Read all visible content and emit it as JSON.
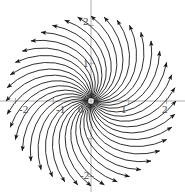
{
  "figure": {
    "kind": "vector-field-phase-portrait",
    "title": "",
    "background_color": "#ffffff",
    "arrow_color": "#1a1a1a",
    "axis_color": "#9a9a9a",
    "label_color": "#4a4a4a"
  },
  "axes": {
    "x_axis_y_pixel": 101,
    "y_axis_x_pixel": 91,
    "xlabels": [
      {
        "text": "-2",
        "value": -2,
        "x": 19,
        "y": 104
      },
      {
        "text": "-1",
        "value": -1,
        "x": 56,
        "y": 104
      },
      {
        "text": "0",
        "value": 0,
        "x": 78,
        "y": 104
      },
      {
        "text": "1",
        "value": 1,
        "x": 121,
        "y": 104
      },
      {
        "text": "2",
        "value": 2,
        "x": 162,
        "y": 104
      }
    ],
    "ylabels": [
      {
        "text": "2",
        "value": 2,
        "x": 83,
        "y": 16
      },
      {
        "text": "1",
        "value": 1,
        "x": 83,
        "y": 58
      },
      {
        "text": "-2",
        "value": -2,
        "x": 80,
        "y": 170
      }
    ],
    "xticks": [
      -2,
      -1,
      0,
      1,
      2
    ],
    "yticks": [
      -2,
      -1,
      0,
      1,
      2
    ],
    "xlim": [
      -2.45,
      2.45
    ],
    "ylim": [
      -2.45,
      2.45
    ],
    "grid": false
  },
  "chart_data": {
    "type": "scatter",
    "title": "",
    "xlabel": "",
    "ylabel": "",
    "xlim": [
      -2.45,
      2.45
    ],
    "ylim": [
      -2.45,
      2.45
    ],
    "grid": false,
    "field": {
      "rays": 40,
      "ray_angle_step_deg": 9,
      "r_start": 0.08,
      "r_end": 2.25,
      "spiral_twist_deg": 72,
      "arrowhead_at": "outer_end"
    }
  }
}
